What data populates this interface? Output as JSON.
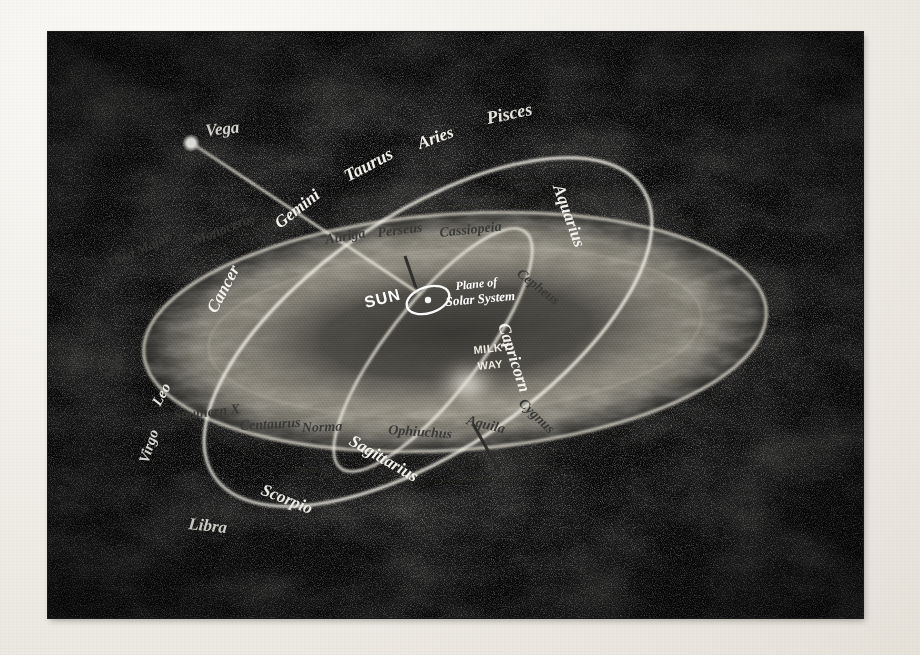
{
  "figure": {
    "name": "milky-way-zodiac-plate",
    "media": "halftone-photograph",
    "plate_bg_color": "#0a0a0a",
    "page_bg_color": "#f2f0ec",
    "bright_label_color": "#f4f2ec",
    "dark_label_color": "#3a3a38"
  },
  "star": {
    "name": "Vega",
    "label": "Vega"
  },
  "sun": {
    "label": "SUN"
  },
  "annotations": {
    "plane_line1": "Plane of",
    "plane_line2": "Solar System",
    "milky_way_line1": "MILKY",
    "milky_way_line2": "WAY"
  },
  "zodiac": {
    "title": "Zodiac / Ecliptic ring",
    "labels": [
      {
        "text": "Gemini",
        "x": 232,
        "y": 197,
        "rot": -38,
        "size": 17,
        "style": "bright"
      },
      {
        "text": "Taurus",
        "x": 300,
        "y": 150,
        "rot": -28,
        "size": 18,
        "style": "bright"
      },
      {
        "text": "Aries",
        "x": 372,
        "y": 117,
        "rot": -20,
        "size": 17,
        "style": "bright"
      },
      {
        "text": "Pisces",
        "x": 440,
        "y": 92,
        "rot": -12,
        "size": 18,
        "style": "bright"
      },
      {
        "text": "Aquarius",
        "x": 505,
        "y": 155,
        "rot": 70,
        "size": 17,
        "style": "bright"
      },
      {
        "text": "Capricorn",
        "x": 450,
        "y": 293,
        "rot": 72,
        "size": 17,
        "style": "bright"
      },
      {
        "text": "Sagittarius",
        "x": 300,
        "y": 412,
        "rot": 30,
        "size": 17,
        "style": "bright"
      },
      {
        "text": "Scorpio",
        "x": 212,
        "y": 462,
        "rot": 22,
        "size": 17,
        "style": "bright"
      },
      {
        "text": "Libra",
        "x": 140,
        "y": 497,
        "rot": 6,
        "size": 17,
        "style": "bright"
      },
      {
        "text": "Virgo",
        "x": 100,
        "y": 432,
        "rot": -72,
        "size": 15,
        "style": "bright"
      },
      {
        "text": "Leo",
        "x": 112,
        "y": 375,
        "rot": -62,
        "size": 15,
        "style": "bright"
      },
      {
        "text": "Cancer",
        "x": 168,
        "y": 282,
        "rot": -62,
        "size": 17,
        "style": "bright"
      }
    ]
  },
  "constellations": {
    "title": "Background constellations (dark lettering)",
    "labels": [
      {
        "text": "Ursa Major",
        "x": 62,
        "y": 236,
        "rot": -24,
        "size": 14,
        "style": "dark"
      },
      {
        "text": "Monoceros",
        "x": 148,
        "y": 213,
        "rot": -22,
        "size": 14,
        "style": "dark"
      },
      {
        "text": "Auriga",
        "x": 278,
        "y": 212,
        "rot": -10,
        "size": 14,
        "style": "dark"
      },
      {
        "text": "Perseus",
        "x": 330,
        "y": 205,
        "rot": -7,
        "size": 14,
        "style": "dark"
      },
      {
        "text": "Cassiopeia",
        "x": 392,
        "y": 205,
        "rot": -6,
        "size": 14,
        "style": "dark"
      },
      {
        "text": "Cepheus",
        "x": 468,
        "y": 243,
        "rot": 38,
        "size": 14,
        "style": "dark"
      },
      {
        "text": "Cygnus",
        "x": 470,
        "y": 372,
        "rot": 44,
        "size": 14,
        "style": "dark"
      },
      {
        "text": "Aquila",
        "x": 418,
        "y": 392,
        "rot": 14,
        "size": 14,
        "style": "dark"
      },
      {
        "text": "Ophiuchus",
        "x": 340,
        "y": 402,
        "rot": 4,
        "size": 14,
        "style": "dark"
      },
      {
        "text": "Norma",
        "x": 254,
        "y": 400,
        "rot": -2,
        "size": 14,
        "style": "dark"
      },
      {
        "text": "Centaurus",
        "x": 192,
        "y": 398,
        "rot": -3,
        "size": 14,
        "style": "dark"
      },
      {
        "text": "Southern X",
        "x": 126,
        "y": 388,
        "rot": -6,
        "size": 14,
        "style": "dark"
      },
      {
        "text": "Argo",
        "x": 62,
        "y": 350,
        "rot": -62,
        "size": 14,
        "style": "dark"
      }
    ]
  },
  "legend": {
    "disk_name": "Milky Way galactic disk",
    "ring_name": "Zodiac ring (ecliptic)",
    "sun_orbit_name": "Sun position ring",
    "vega_line_name": "Direction of solar motion toward Vega"
  }
}
